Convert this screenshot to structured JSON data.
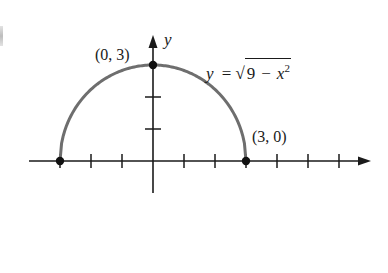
{
  "chart_data": {
    "type": "line",
    "title": "",
    "function": "y = sqrt(9 - x^2)",
    "xlabel": "",
    "ylabel": "y",
    "xlim": [
      -4,
      7.5
    ],
    "ylim": [
      -1,
      4
    ],
    "x_ticks": [
      -3,
      -2,
      -1,
      1,
      2,
      3,
      4,
      5,
      6
    ],
    "y_ticks": [
      1,
      2,
      3
    ],
    "grid": false,
    "legend": null,
    "series": [
      {
        "name": "y = √(9 − x²)",
        "color": "#6e6e6e",
        "x": [
          -3,
          -2.5,
          -2,
          -1.5,
          -1,
          -0.5,
          0,
          0.5,
          1,
          1.5,
          2,
          2.5,
          3
        ],
        "y": [
          0,
          1.66,
          2.24,
          2.6,
          2.83,
          2.96,
          3,
          2.96,
          2.83,
          2.6,
          2.24,
          1.66,
          0
        ]
      }
    ],
    "points": [
      {
        "x": -3,
        "y": 0,
        "label": ""
      },
      {
        "x": 0,
        "y": 3,
        "label": "(0, 3)"
      },
      {
        "x": 3,
        "y": 0,
        "label": "(3, 0)"
      }
    ],
    "annotations": [
      {
        "text": "(0, 3)",
        "near": [
          0,
          3
        ]
      },
      {
        "text": "(3, 0)",
        "near": [
          3,
          0
        ]
      },
      {
        "text": "y = √(9 − x²)",
        "near": [
          2.5,
          2.6
        ]
      }
    ]
  },
  "labels": {
    "y_axis": "y",
    "point_top": "(0, 3)",
    "point_right": "(3, 0)",
    "equation": {
      "lhs": "y",
      "equals": "=",
      "radical_sign": "√",
      "radicand_const": "9",
      "minus": "−",
      "var": "x",
      "exponent": "2"
    }
  },
  "colors": {
    "axis": "#1a1a1a",
    "curve": "#6e6e6e",
    "point": "#111111"
  }
}
